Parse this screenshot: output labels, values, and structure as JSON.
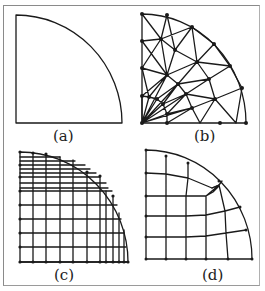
{
  "figure": {
    "panels": [
      {
        "id": "a",
        "label": "(a)",
        "description": "Quarter-circle domain geometry"
      },
      {
        "id": "b",
        "label": "(b)",
        "description": "Unstructured triangular mesh"
      },
      {
        "id": "c",
        "label": "(c)",
        "description": "Cartesian grid overlaid on quarter-circle"
      },
      {
        "id": "d",
        "label": "(d)",
        "description": "Structured quadrilateral block mesh"
      }
    ],
    "colors": {
      "line": "#1a1a1a",
      "border": "#8a8a8a",
      "background": "#ffffff"
    }
  }
}
